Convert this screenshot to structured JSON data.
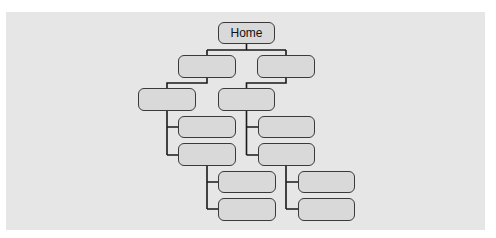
{
  "diagram": {
    "type": "sitemap-tree",
    "colors": {
      "panel_background": "#e6e6e6",
      "node_fill": "#d9d9d9",
      "node_border": "#3a3a3a",
      "connector": "#1a1a1a"
    },
    "nodes": [
      {
        "id": "home",
        "label": "Home",
        "level": 0,
        "parent": null
      },
      {
        "id": "l1-a",
        "label": "",
        "level": 1,
        "parent": "home"
      },
      {
        "id": "l1-b",
        "label": "",
        "level": 1,
        "parent": "home"
      },
      {
        "id": "l2-a",
        "label": "",
        "level": 2,
        "parent": "l1-a"
      },
      {
        "id": "l2-b",
        "label": "",
        "level": 2,
        "parent": "l1-b"
      },
      {
        "id": "l3-a1",
        "label": "",
        "level": 3,
        "parent": "l2-a"
      },
      {
        "id": "l3-a2",
        "label": "",
        "level": 3,
        "parent": "l2-a"
      },
      {
        "id": "l3-b1",
        "label": "",
        "level": 3,
        "parent": "l2-b"
      },
      {
        "id": "l3-b2",
        "label": "",
        "level": 3,
        "parent": "l2-b"
      },
      {
        "id": "l4-a1",
        "label": "",
        "level": 4,
        "parent": "l3-a2"
      },
      {
        "id": "l4-a2",
        "label": "",
        "level": 4,
        "parent": "l3-a2"
      },
      {
        "id": "l4-b1",
        "label": "",
        "level": 4,
        "parent": "l3-b2"
      },
      {
        "id": "l4-b2",
        "label": "",
        "level": 4,
        "parent": "l3-b2"
      }
    ]
  }
}
